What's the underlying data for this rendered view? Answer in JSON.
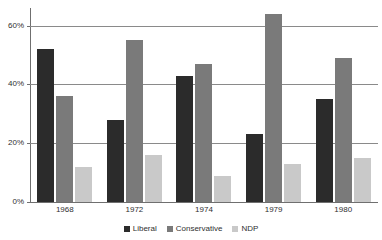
{
  "chart_data": {
    "type": "bar",
    "title": "",
    "xlabel": "",
    "ylabel": "",
    "categories": [
      "1968",
      "1972",
      "1974",
      "1979",
      "1980"
    ],
    "series": [
      {
        "name": "Liberal",
        "color": "#2b2b2b",
        "values": [
          52,
          28,
          43,
          23,
          35
        ]
      },
      {
        "name": "Conservative",
        "color": "#7a7a7a",
        "values": [
          36,
          55,
          47,
          64,
          49
        ]
      },
      {
        "name": "NDP",
        "color": "#c9c9c9",
        "values": [
          12,
          16,
          9,
          13,
          15
        ]
      }
    ],
    "ylim": [
      0,
      66
    ],
    "yticks": [
      0,
      20,
      40,
      60
    ],
    "ytick_labels": [
      "0%",
      "20%",
      "40%",
      "60%"
    ],
    "grid": true,
    "legend_position": "bottom",
    "value_suffix": "%"
  },
  "legend": {
    "items": [
      {
        "label": "Liberal",
        "color": "#2b2b2b"
      },
      {
        "label": "Conservative",
        "color": "#7a7a7a"
      },
      {
        "label": "NDP",
        "color": "#c9c9c9"
      }
    ]
  }
}
